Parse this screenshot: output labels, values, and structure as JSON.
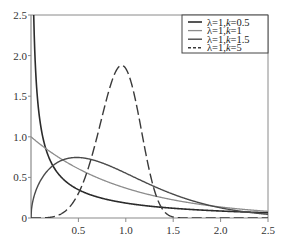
{
  "chart_data": {
    "type": "line",
    "title": "",
    "xlabel": "",
    "ylabel": "",
    "xlim": [
      0,
      2.5
    ],
    "ylim": [
      0,
      2.5
    ],
    "grid": false,
    "legend_position": "upper right",
    "x_ticks": [
      {
        "value": 0.5,
        "label": "0.5"
      },
      {
        "value": 1.0,
        "label": "1.0"
      },
      {
        "value": 1.5,
        "label": "1.5"
      },
      {
        "value": 2.0,
        "label": "2.0"
      },
      {
        "value": 2.5,
        "label": "2.5"
      }
    ],
    "y_ticks": [
      {
        "value": 0,
        "label": "0"
      },
      {
        "value": 0.5,
        "label": "0.5"
      },
      {
        "value": 1.0,
        "label": "1.0"
      },
      {
        "value": 1.5,
        "label": "1.5"
      },
      {
        "value": 2.0,
        "label": "2.0"
      },
      {
        "value": 2.5,
        "label": "2.5"
      }
    ],
    "function": "Weibull PDF f(x) = (k/λ)(x/λ)^(k-1) exp(-(x/λ)^k)",
    "series": [
      {
        "name": "λ=1,k=0.5",
        "lambda_label": "λ=1,",
        "k_label": "k",
        "k_value_label": "=0.5",
        "lambda": 1,
        "k": 0.5,
        "color": "#2b2b2b",
        "width": 1.6,
        "dash": "",
        "x": [
          0.02,
          0.05,
          0.1,
          0.2,
          0.3,
          0.5,
          0.75,
          1.0,
          1.5,
          2.0,
          2.5
        ],
        "values": [
          2.98,
          1.79,
          1.15,
          0.72,
          0.53,
          0.35,
          0.24,
          0.18,
          0.12,
          0.09,
          0.07
        ]
      },
      {
        "name": "λ=1,k=1",
        "lambda_label": "λ=1,",
        "k_label": "k",
        "k_value_label": "=1",
        "lambda": 1,
        "k": 1,
        "color": "#8c8c8c",
        "width": 1.3,
        "dash": "",
        "x": [
          0,
          0.25,
          0.5,
          0.75,
          1.0,
          1.5,
          2.0,
          2.5
        ],
        "values": [
          1.0,
          0.78,
          0.61,
          0.47,
          0.37,
          0.22,
          0.14,
          0.08
        ]
      },
      {
        "name": "λ=1,k=1.5",
        "lambda_label": "λ=1,",
        "k_label": "k",
        "k_value_label": "=1.5",
        "lambda": 1,
        "k": 1.5,
        "color": "#4a4a4a",
        "width": 1.4,
        "dash": "",
        "x": [
          0,
          0.25,
          0.5,
          0.75,
          1.0,
          1.25,
          1.5,
          2.0,
          2.5
        ],
        "values": [
          0,
          0.66,
          0.74,
          0.68,
          0.55,
          0.41,
          0.29,
          0.12,
          0.04
        ]
      },
      {
        "name": "λ=1,k=5",
        "lambda_label": "λ=1,",
        "k_label": "k",
        "k_value_label": "=5",
        "lambda": 1,
        "k": 5,
        "color": "#3a3a3a",
        "width": 1.4,
        "dash": "10,4",
        "x": [
          0,
          0.25,
          0.5,
          0.75,
          0.96,
          1.0,
          1.25,
          1.5
        ],
        "values": [
          0,
          0.02,
          0.3,
          1.25,
          1.88,
          1.84,
          0.46,
          0.0
        ]
      }
    ]
  },
  "plot_px": {
    "left": 31,
    "right": 268,
    "top": 15,
    "bottom": 218
  },
  "legend_px": {
    "left": 182,
    "top": 15,
    "right": 268,
    "bottom": 53
  }
}
